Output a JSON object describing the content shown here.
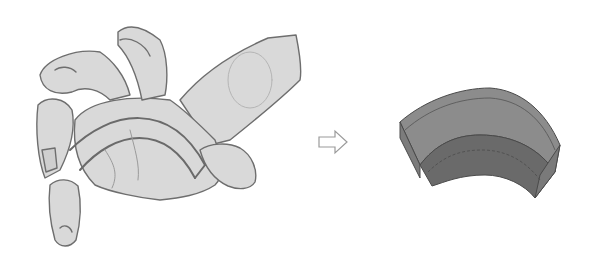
{
  "illustration": {
    "left": {
      "subject": "hand-sketch",
      "description": "Gray pencil sketch of a foreshortened reaching hand with guide arc across the palm"
    },
    "middle": {
      "symbol": "right-arrow-outline"
    },
    "right": {
      "subject": "3d-curved-block",
      "description": "Shaded 3D curved wedge/arch block simplifying the palm form"
    }
  },
  "colors": {
    "background": "#ffffff",
    "hand_fill": "#d9d9d9",
    "hand_line": "#6e6e6e",
    "block_top": "#8c8c8c",
    "block_front": "#6a6a6a",
    "block_line": "#4a4a4a",
    "arrow_line": "#9a9a9a"
  }
}
